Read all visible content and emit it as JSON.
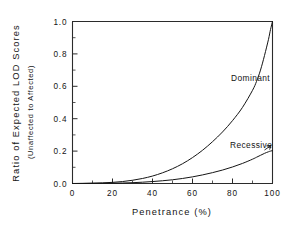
{
  "figure": {
    "background_color": "#ffffff",
    "line_color": "#151515",
    "axis_color": "#2b2b2b"
  },
  "axes": {
    "x_title": "Penetrance  (%)",
    "y_title_line1": "Ratio of Expected LOD Scores",
    "y_title_line2": "(Unaffected to Affected)",
    "x_ticklabels": [
      "0",
      "20",
      "40",
      "60",
      "80",
      "100"
    ],
    "y_ticklabels": [
      "0.0",
      "0.2",
      "0.4",
      "0.6",
      "0.8",
      "1.0"
    ]
  },
  "annotations": {
    "dominant_label": "Dominant",
    "recessive_label": "Recessive"
  },
  "chart_data": {
    "type": "line",
    "title": "",
    "xlabel": "Penetrance  (%)",
    "ylabel": "Ratio of Expected LOD Scores (Unaffected to Affected)",
    "xlim": [
      0,
      100
    ],
    "ylim": [
      0.0,
      1.0
    ],
    "xticks": [
      0,
      20,
      40,
      60,
      80,
      100
    ],
    "yticks": [
      0.0,
      0.2,
      0.4,
      0.6,
      0.8,
      1.0
    ],
    "x_minor_tick_step": 10,
    "y_minor_tick_step": 0.1,
    "grid": false,
    "legend": "inline-annotations",
    "x": [
      0,
      5,
      10,
      15,
      20,
      25,
      30,
      35,
      40,
      45,
      50,
      55,
      60,
      65,
      70,
      75,
      80,
      85,
      90,
      92,
      94,
      96,
      98,
      99,
      100
    ],
    "series": [
      {
        "name": "Dominant",
        "values": [
          0.0,
          0.001,
          0.002,
          0.004,
          0.007,
          0.012,
          0.02,
          0.031,
          0.046,
          0.066,
          0.091,
          0.122,
          0.16,
          0.205,
          0.258,
          0.318,
          0.388,
          0.47,
          0.575,
          0.63,
          0.7,
          0.79,
          0.89,
          0.95,
          1.0
        ],
        "label_position": {
          "x": 78,
          "y": 0.645
        }
      },
      {
        "name": "Recessive",
        "values": [
          0.0,
          0.0,
          0.001,
          0.001,
          0.002,
          0.003,
          0.005,
          0.008,
          0.012,
          0.017,
          0.023,
          0.031,
          0.041,
          0.053,
          0.067,
          0.083,
          0.102,
          0.124,
          0.15,
          0.162,
          0.174,
          0.186,
          0.196,
          0.2,
          0.203
        ],
        "label_position": {
          "x": 83,
          "y": 0.215
        }
      }
    ]
  }
}
